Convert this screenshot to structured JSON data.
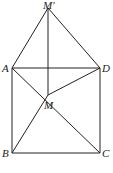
{
  "diagram": {
    "points": {
      "M_prime": {
        "label": "M′",
        "x": 48,
        "y": 8
      },
      "A": {
        "label": "A",
        "x": 12,
        "y": 68
      },
      "D": {
        "label": "D",
        "x": 100,
        "y": 68
      },
      "M": {
        "label": "M",
        "x": 48,
        "y": 95
      },
      "B": {
        "label": "B",
        "x": 12,
        "y": 153
      },
      "C": {
        "label": "C",
        "x": 100,
        "y": 153
      }
    },
    "segments": [
      "M'A",
      "M'D",
      "M'M",
      "AD",
      "AB",
      "DC",
      "BC",
      "AC",
      "BD",
      "AM",
      "DM"
    ]
  }
}
